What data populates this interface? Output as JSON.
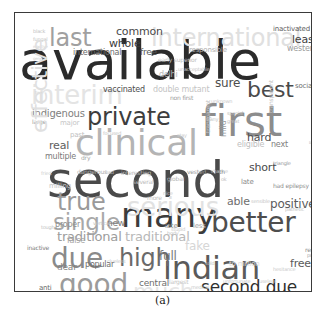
{
  "figure": {
    "caption": "(a)",
    "type": "wordcloud",
    "background": "#ffffff",
    "border_color": "#3a3a3a"
  },
  "chart_data": {
    "type": "wordcloud",
    "title": "",
    "subtitle": "",
    "xlabel": "",
    "ylabel": "",
    "legend": [],
    "grid": false,
    "colormap": "greys",
    "note": "Word cloud of adjective terms; font size encodes frequency, grey level encodes weight.",
    "words": [
      {
        "text": "available",
        "size": 54,
        "color": "#2b2b2b",
        "x": 4,
        "y": 22,
        "rot": 0
      },
      {
        "text": "second",
        "size": 50,
        "color": "#4a4a4a",
        "x": 32,
        "y": 143,
        "rot": 0
      },
      {
        "text": "first",
        "size": 42,
        "color": "#8c8c8c",
        "x": 186,
        "y": 88,
        "rot": 0
      },
      {
        "text": "many",
        "size": 34,
        "color": "#3c3c3c",
        "x": 106,
        "y": 186,
        "rot": 0
      },
      {
        "text": "clinical",
        "size": 36,
        "color": "#b4b4b4",
        "x": 60,
        "y": 112,
        "rot": 0
      },
      {
        "text": "indian",
        "size": 32,
        "color": "#5a5a5a",
        "x": 148,
        "y": 240,
        "rot": 0
      },
      {
        "text": "better",
        "size": 28,
        "color": "#4e4e4e",
        "x": 196,
        "y": 196,
        "rot": 0
      },
      {
        "text": "good",
        "size": 28,
        "color": "#9b9b9b",
        "x": 44,
        "y": 258,
        "rot": 0
      },
      {
        "text": "due",
        "size": 28,
        "color": "#8a8a8a",
        "x": 36,
        "y": 232,
        "rot": 0
      },
      {
        "text": "private",
        "size": 24,
        "color": "#3d3d3d",
        "x": 72,
        "y": 93,
        "rot": 0
      },
      {
        "text": "true",
        "size": 24,
        "color": "#9a9a9a",
        "x": 42,
        "y": 178,
        "rot": 0
      },
      {
        "text": "single",
        "size": 23,
        "color": "#a8a8a8",
        "x": 38,
        "y": 198,
        "rot": 0
      },
      {
        "text": "high",
        "size": 24,
        "color": "#6a6a6a",
        "x": 104,
        "y": 234,
        "rot": 0
      },
      {
        "text": "best",
        "size": 22,
        "color": "#4a4a4a",
        "x": 232,
        "y": 66,
        "rot": 0
      },
      {
        "text": "last",
        "size": 24,
        "color": "#a0a0a0",
        "x": 34,
        "y": 14,
        "rot": 0
      },
      {
        "text": "second due",
        "size": 17,
        "color": "#2f2f2f",
        "x": 186,
        "y": 266,
        "rot": 0
      },
      {
        "text": "serious",
        "size": 26,
        "color": "#e2e2e2",
        "x": 112,
        "y": 182,
        "rot": 0
      },
      {
        "text": "international",
        "size": 24,
        "color": "#e0e0e0",
        "x": 136,
        "y": 14,
        "rot": 0
      },
      {
        "text": "interim",
        "size": 26,
        "color": "#e4e4e4",
        "x": 16,
        "y": 70,
        "rot": 0
      },
      {
        "text": "much",
        "size": 22,
        "color": "#e6e6e6",
        "x": 118,
        "y": 268,
        "rot": 0
      },
      {
        "text": "traditional",
        "size": 13,
        "color": "#9c9c9c",
        "x": 42,
        "y": 218,
        "rot": 0
      },
      {
        "text": "traditional",
        "size": 13,
        "color": "#b8b8b8",
        "x": 110,
        "y": 218,
        "rot": 0
      },
      {
        "text": "positive",
        "size": 12,
        "color": "#5c5c5c",
        "x": 255,
        "y": 186,
        "rot": 0
      },
      {
        "text": "able",
        "size": 11,
        "color": "#6e6e6e",
        "x": 212,
        "y": 184,
        "rot": 0
      },
      {
        "text": "free",
        "size": 11,
        "color": "#5a5a5a",
        "x": 275,
        "y": 246,
        "rot": 0
      },
      {
        "text": "hard",
        "size": 11,
        "color": "#4e4e4e",
        "x": 232,
        "y": 120,
        "rot": 0
      },
      {
        "text": "short",
        "size": 11,
        "color": "#4a4a4a",
        "x": 234,
        "y": 150,
        "rot": 0
      },
      {
        "text": "sure",
        "size": 12,
        "color": "#4d4d4d",
        "x": 200,
        "y": 65,
        "rot": 0
      },
      {
        "text": "least",
        "size": 11,
        "color": "#3f3f3f",
        "x": 277,
        "y": 22,
        "rot": 0
      },
      {
        "text": "inactivated",
        "size": 7,
        "color": "#5c5c5c",
        "x": 258,
        "y": 13,
        "rot": 0
      },
      {
        "text": "western",
        "size": 8,
        "color": "#9a9a9a",
        "x": 272,
        "y": 32,
        "rot": 0
      },
      {
        "text": "common",
        "size": 11,
        "color": "#4a4a4a",
        "x": 101,
        "y": 14,
        "rot": 0
      },
      {
        "text": "whole",
        "size": 11,
        "color": "#3a3a3a",
        "x": 94,
        "y": 26,
        "rot": 0
      },
      {
        "text": "international",
        "size": 8,
        "color": "#6a6a6a",
        "x": 58,
        "y": 36,
        "rot": 0
      },
      {
        "text": "free",
        "size": 9,
        "color": "#5a5a5a",
        "x": 125,
        "y": 35,
        "rot": 0
      },
      {
        "text": "responsible",
        "size": 7,
        "color": "#b0b0b0",
        "x": 174,
        "y": 34,
        "rot": 0
      },
      {
        "text": "vaccinated",
        "size": 8,
        "color": "#4d4d4d",
        "x": 88,
        "y": 73,
        "rot": 0
      },
      {
        "text": "double mutant",
        "size": 8,
        "color": "#c4c4c4",
        "x": 138,
        "y": 73,
        "rot": 0
      },
      {
        "text": "non first",
        "size": 6,
        "color": "#9c9c9c",
        "x": 155,
        "y": 82,
        "rot": 0
      },
      {
        "text": "delhi",
        "size": 8,
        "color": "#b8b8b8",
        "x": 144,
        "y": 58,
        "rot": 0
      },
      {
        "text": "early superior",
        "size": 6,
        "color": "#c0c0c0",
        "x": 143,
        "y": 44,
        "rot": 0
      },
      {
        "text": "unacceptable",
        "size": 5,
        "color": "#c8c8c8",
        "x": 163,
        "y": 54,
        "rot": 0
      },
      {
        "text": "indigenous",
        "size": 10,
        "color": "#808080",
        "x": 17,
        "y": 96,
        "rot": 0
      },
      {
        "text": "large",
        "size": 6,
        "color": "#a0a0a0",
        "x": 17,
        "y": 106,
        "rot": 0
      },
      {
        "text": "major",
        "size": 7,
        "color": "#c6c6c6",
        "x": 45,
        "y": 107,
        "rot": 0
      },
      {
        "text": "past",
        "size": 7,
        "color": "#c0c0c0",
        "x": 55,
        "y": 119,
        "rot": 0
      },
      {
        "text": "real",
        "size": 11,
        "color": "#5e5e5e",
        "x": 34,
        "y": 128,
        "rot": 0
      },
      {
        "text": "multiple",
        "size": 8,
        "color": "#7a7a7a",
        "x": 30,
        "y": 140,
        "rot": 0
      },
      {
        "text": "dry",
        "size": 6,
        "color": "#a6a6a6",
        "x": 66,
        "y": 142,
        "rot": 0
      },
      {
        "text": "dangerous",
        "size": 6,
        "color": "#b0b0b0",
        "x": 62,
        "y": 156,
        "rot": 0
      },
      {
        "text": "bad",
        "size": 5,
        "color": "#c2c2c2",
        "x": 90,
        "y": 157,
        "rot": 0
      },
      {
        "text": "interesting",
        "size": 6,
        "color": "#b8b8b8",
        "x": 106,
        "y": 157,
        "rot": 0
      },
      {
        "text": "vested",
        "size": 6,
        "color": "#9a9a9a",
        "x": 172,
        "y": 156,
        "rot": 0
      },
      {
        "text": "fried",
        "size": 5,
        "color": "#cfcfcf",
        "x": 26,
        "y": 158,
        "rot": 0
      },
      {
        "text": "milling",
        "size": 7,
        "color": "#c5c5c5",
        "x": 34,
        "y": 170,
        "rot": 0
      },
      {
        "text": "several",
        "size": 6,
        "color": "#bcbcbc",
        "x": 118,
        "y": 166,
        "rot": 0
      },
      {
        "text": "global",
        "size": 6,
        "color": "#b6b6b6",
        "x": 152,
        "y": 163,
        "rot": 0
      },
      {
        "text": "late",
        "size": 7,
        "color": "#8a8a8a",
        "x": 226,
        "y": 166,
        "rot": 0
      },
      {
        "text": "nice",
        "size": 5,
        "color": "#c7c7c7",
        "x": 148,
        "y": 178,
        "rot": 0
      },
      {
        "text": "more",
        "size": 6,
        "color": "#c0c0c0",
        "x": 132,
        "y": 182,
        "rot": 0
      },
      {
        "text": "proper",
        "size": 8,
        "color": "#8e8e8e",
        "x": 40,
        "y": 208,
        "rot": 0
      },
      {
        "text": "new",
        "size": 9,
        "color": "#7c7c7c",
        "x": 92,
        "y": 206,
        "rot": 0
      },
      {
        "text": "vertical",
        "size": 5,
        "color": "#c0c0c0",
        "x": 78,
        "y": 208,
        "rot": 0
      },
      {
        "text": "tough",
        "size": 5,
        "color": "#c2c2c2",
        "x": 26,
        "y": 212,
        "rot": 0
      },
      {
        "text": "late",
        "size": 7,
        "color": "#909090",
        "x": 150,
        "y": 210,
        "rot": 0
      },
      {
        "text": "less",
        "size": 7,
        "color": "#a8a8a8",
        "x": 178,
        "y": 210,
        "rot": 0
      },
      {
        "text": "body",
        "size": 5,
        "color": "#c0c0c0",
        "x": 152,
        "y": 218,
        "rot": 0
      },
      {
        "text": "stupid",
        "size": 5,
        "color": "#c8c8c8",
        "x": 156,
        "y": 214,
        "rot": 0
      },
      {
        "text": "false",
        "size": 8,
        "color": "#a6a6a6",
        "x": 52,
        "y": 224,
        "rot": 0
      },
      {
        "text": "inactive",
        "size": 6,
        "color": "#7e7e7e",
        "x": 12,
        "y": 232,
        "rot": 0
      },
      {
        "text": "fake",
        "size": 12,
        "color": "#d6d6d6",
        "x": 170,
        "y": 228,
        "rot": 0
      },
      {
        "text": "full",
        "size": 12,
        "color": "#7a7a7a",
        "x": 144,
        "y": 238,
        "rot": 0
      },
      {
        "text": "clueless",
        "size": 5,
        "color": "#c4c4c4",
        "x": 92,
        "y": 246,
        "rot": 0
      },
      {
        "text": "dear",
        "size": 9,
        "color": "#808080",
        "x": 42,
        "y": 250,
        "rot": 0
      },
      {
        "text": "popular",
        "size": 8,
        "color": "#6e6e6e",
        "x": 70,
        "y": 248,
        "rot": 0
      },
      {
        "text": "central",
        "size": 9,
        "color": "#6e6e6e",
        "x": 124,
        "y": 266,
        "rot": 0
      },
      {
        "text": "anti",
        "size": 7,
        "color": "#6a6a6a",
        "x": 24,
        "y": 272,
        "rot": 0
      },
      {
        "text": "big",
        "size": 9,
        "color": "#c0c0c0",
        "x": 16,
        "y": 282,
        "rot": 0
      },
      {
        "text": "entire",
        "size": 8,
        "color": "#9e9e9e",
        "x": 86,
        "y": 284,
        "rot": 0
      },
      {
        "text": "adverse",
        "size": 5,
        "color": "#cecece",
        "x": 50,
        "y": 284,
        "rot": 0
      },
      {
        "text": "largest",
        "size": 6,
        "color": "#c4c4c4",
        "x": 154,
        "y": 266,
        "rot": 0
      },
      {
        "text": "medical",
        "size": 5,
        "color": "#c8c8c8",
        "x": 176,
        "y": 272,
        "rot": 0
      },
      {
        "text": "clear",
        "size": 5,
        "color": "#cccccc",
        "x": 174,
        "y": 280,
        "rot": 0
      },
      {
        "text": "unfortunate",
        "size": 5,
        "color": "#c6c6c6",
        "x": 208,
        "y": 266,
        "rot": 0
      },
      {
        "text": "useless",
        "size": 5,
        "color": "#cacaca",
        "x": 244,
        "y": 266,
        "rot": 0
      },
      {
        "text": "shameless",
        "size": 5,
        "color": "#cccccc",
        "x": 226,
        "y": 284,
        "rot": 0
      },
      {
        "text": "popular",
        "size": 5,
        "color": "#c8c8c8",
        "x": 276,
        "y": 284,
        "rot": 0
      },
      {
        "text": "to million",
        "size": 7,
        "color": "#dcdcdc",
        "x": 214,
        "y": 248,
        "rot": 0
      },
      {
        "text": "sold",
        "size": 5,
        "color": "#c0c0c0",
        "x": 190,
        "y": 248,
        "rot": 0
      },
      {
        "text": "hesitance",
        "size": 5,
        "color": "#cacaca",
        "x": 258,
        "y": 254,
        "rot": 0
      },
      {
        "text": "had epilepsy",
        "size": 6,
        "color": "#8e8e8e",
        "x": 258,
        "y": 170,
        "rot": 0
      },
      {
        "text": "pathetic",
        "size": 5,
        "color": "#c0c0c0",
        "x": 270,
        "y": 194,
        "rot": 0
      },
      {
        "text": "sensible",
        "size": 5,
        "color": "#c6c6c6",
        "x": 236,
        "y": 186,
        "rot": 0
      },
      {
        "text": "agri",
        "size": 5,
        "color": "#b4b4b4",
        "x": 296,
        "y": 212,
        "rot": 0
      },
      {
        "text": "rare",
        "size": 5,
        "color": "#c0c0c0",
        "x": 296,
        "y": 226,
        "rot": 0
      },
      {
        "text": "recent",
        "size": 6,
        "color": "#8e8e8e",
        "x": 290,
        "y": 234,
        "rot": 0
      },
      {
        "text": "public",
        "size": 5,
        "color": "#a8a8a8",
        "x": 292,
        "y": 240,
        "rot": 0
      },
      {
        "text": "social",
        "size": 7,
        "color": "#6e6e6e",
        "x": 280,
        "y": 70,
        "rot": 0
      },
      {
        "text": "next",
        "size": 8,
        "color": "#7e7e7e",
        "x": 256,
        "y": 128,
        "rot": 0
      },
      {
        "text": "eligible",
        "size": 8,
        "color": "#c0c0c0",
        "x": 222,
        "y": 128,
        "rot": 0
      },
      {
        "text": "triangle",
        "size": 5,
        "color": "#9a9a9a",
        "x": 258,
        "y": 148,
        "rot": 0
      },
      {
        "text": "right",
        "size": 8,
        "color": "#707070",
        "x": 296,
        "y": 140,
        "rot": 0
      },
      {
        "text": "bound",
        "size": 4,
        "color": "#c4c4c4",
        "x": 294,
        "y": 128,
        "rot": 0
      },
      {
        "text": "special",
        "size": 5,
        "color": "#b8b8b8",
        "x": 212,
        "y": 98,
        "rot": 0
      },
      {
        "text": "great",
        "size": 5,
        "color": "#c4c4c4",
        "x": 212,
        "y": 106,
        "rot": 0
      },
      {
        "text": "many",
        "size": 5,
        "color": "#c6c6c6",
        "x": 190,
        "y": 104,
        "rot": 0
      },
      {
        "text": "unknown",
        "size": 5,
        "color": "#c8c8c8",
        "x": 196,
        "y": 86,
        "rot": 0
      },
      {
        "text": "black",
        "size": 5,
        "color": "#c0c0c0",
        "x": 18,
        "y": 16,
        "rot": 0
      },
      {
        "text": "fungal",
        "size": 5,
        "color": "#c4c4c4",
        "x": 18,
        "y": 24,
        "rot": 0
      },
      {
        "text": "reactive",
        "size": 4,
        "color": "#cccccc",
        "x": 18,
        "y": 32,
        "rot": 0
      },
      {
        "text": "general",
        "size": 4,
        "color": "#cecece",
        "x": 18,
        "y": 44,
        "rot": 0
      },
      {
        "text": "free",
        "size": 4,
        "color": "#d0d0d0",
        "x": 20,
        "y": 78,
        "rot": 0
      },
      {
        "text": "stay",
        "size": 5,
        "color": "#cacaca",
        "x": 162,
        "y": 120,
        "rot": 0
      },
      {
        "text": "mild",
        "size": 8,
        "color": "#9a9a9a",
        "x": 205,
        "y": 124,
        "rot": -90
      },
      {
        "text": "transparent",
        "size": 6,
        "color": "#c2c2c2",
        "x": 190,
        "y": 120,
        "rot": -90
      },
      {
        "text": "transparent",
        "size": 6,
        "color": "#c2c2c2",
        "x": 253,
        "y": 100,
        "rot": -90
      },
      {
        "text": "effective",
        "size": 22,
        "color": "#e0e0e0",
        "x": 14,
        "y": 120,
        "rot": -90
      },
      {
        "text": "white post",
        "size": 6,
        "color": "#a8a8a8",
        "x": 300,
        "y": 150,
        "rot": -90
      },
      {
        "text": "unsafe",
        "size": 6,
        "color": "#a0a0a0",
        "x": 300,
        "y": 162,
        "rot": -90
      },
      {
        "text": "focused",
        "size": 5,
        "color": "#c6c6c6",
        "x": 88,
        "y": 118,
        "rot": 0
      },
      {
        "text": "chance",
        "size": 5,
        "color": "#c8c8c8",
        "x": 196,
        "y": 156,
        "rot": 0
      },
      {
        "text": "ok",
        "size": 5,
        "color": "#c0c0c0",
        "x": 206,
        "y": 164,
        "rot": 0
      },
      {
        "text": "th",
        "size": 6,
        "color": "#8c8c8c",
        "x": 204,
        "y": 156,
        "rot": 0
      }
    ]
  }
}
